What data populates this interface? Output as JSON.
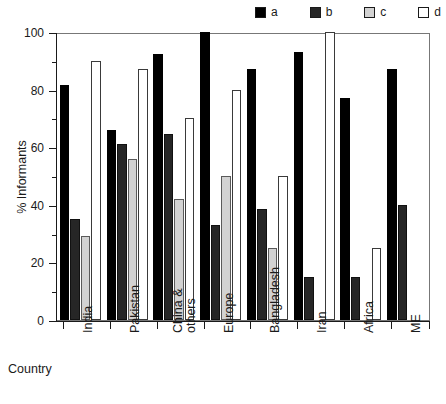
{
  "chart_data": {
    "type": "bar",
    "title": "",
    "xlabel": "Country",
    "ylabel": "% Informants",
    "ylim": [
      0,
      100
    ],
    "y_ticks_major": [
      0,
      20,
      40,
      60,
      80,
      100
    ],
    "y_ticks_minor": [
      10,
      30,
      50,
      70,
      90
    ],
    "grid": false,
    "legend_position": "top-right",
    "categories": [
      "India",
      "Pakistan",
      "China & others",
      "Europe",
      "Bangladesh",
      "Iran",
      "Africa",
      "ME"
    ],
    "category_lines": [
      [
        "India"
      ],
      [
        "Pakistan"
      ],
      [
        "China &",
        "others"
      ],
      [
        "Europe"
      ],
      [
        "Bangladesh"
      ],
      [
        "Iran"
      ],
      [
        "Africa"
      ],
      [
        "ME"
      ]
    ],
    "series": [
      {
        "name": "a",
        "color": "#000000",
        "values": [
          81.5,
          66,
          92.5,
          100,
          87,
          93,
          77,
          87
        ]
      },
      {
        "name": "b",
        "color": "#262626",
        "values": [
          35,
          61,
          64.5,
          33,
          38.5,
          15,
          15,
          40
        ]
      },
      {
        "name": "c",
        "color": "#d2d2d2",
        "values": [
          29,
          56,
          42,
          50,
          25,
          0,
          0,
          0
        ]
      },
      {
        "name": "d",
        "color": "#ffffff",
        "values": [
          90,
          87,
          70,
          80,
          50,
          100,
          25,
          0
        ]
      }
    ]
  },
  "legend": {
    "entries": [
      {
        "label": "a",
        "swatch": "black-square-swatch"
      },
      {
        "label": "b",
        "swatch": "dark-square-swatch"
      },
      {
        "label": "c",
        "swatch": "gray-square-swatch"
      },
      {
        "label": "d",
        "swatch": "white-square-swatch"
      }
    ]
  }
}
